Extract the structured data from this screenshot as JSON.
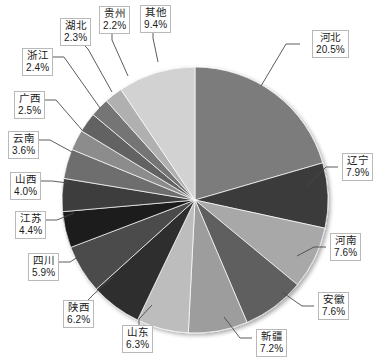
{
  "chart_data": {
    "type": "pie",
    "title": "",
    "subtitle": "",
    "xlabel": "",
    "ylabel": "",
    "legend_position": "none",
    "grid": false,
    "labels_show_percent": true,
    "start_angle_deg": 0,
    "direction": "clockwise",
    "categories": [
      "河北",
      "辽宁",
      "河南",
      "安徽",
      "新疆",
      "山东",
      "陕西",
      "四川",
      "江苏",
      "山西",
      "云南",
      "广西",
      "浙江",
      "湖北",
      "贵州",
      "其他"
    ],
    "values": [
      20.5,
      7.9,
      7.6,
      7.6,
      7.2,
      6.3,
      6.2,
      5.9,
      4.4,
      4.0,
      3.6,
      2.5,
      2.4,
      2.3,
      2.2,
      9.4
    ],
    "unit": "%",
    "colors": [
      "#7b7b7b",
      "#3a3a3a",
      "#a8a8a8",
      "#5e5e5e",
      "#9d9d9d",
      "#bdbdbd",
      "#2e2e2e",
      "#4b4b4b",
      "#1c1c1c",
      "#3d3d3d",
      "#6e6e6e",
      "#8c8c8c",
      "#626262",
      "#747474",
      "#b0b0b0",
      "#d2d2d2"
    ],
    "slices": [
      {
        "label": "河北",
        "percent": "20.5%",
        "value": 20.5,
        "color": "#7b7b7b"
      },
      {
        "label": "辽宁",
        "percent": "7.9%",
        "value": 7.9,
        "color": "#3a3a3a"
      },
      {
        "label": "河南",
        "percent": "7.6%",
        "value": 7.6,
        "color": "#a8a8a8"
      },
      {
        "label": "安徽",
        "percent": "7.6%",
        "value": 7.6,
        "color": "#5e5e5e"
      },
      {
        "label": "新疆",
        "percent": "7.2%",
        "value": 7.2,
        "color": "#9d9d9d"
      },
      {
        "label": "山东",
        "percent": "6.3%",
        "value": 6.3,
        "color": "#bdbdbd"
      },
      {
        "label": "陕西",
        "percent": "6.2%",
        "value": 6.2,
        "color": "#2e2e2e"
      },
      {
        "label": "四川",
        "percent": "5.9%",
        "value": 5.9,
        "color": "#4b4b4b"
      },
      {
        "label": "江苏",
        "percent": "4.4%",
        "value": 4.4,
        "color": "#1c1c1c"
      },
      {
        "label": "山西",
        "percent": "4.0%",
        "value": 4.0,
        "color": "#3d3d3d"
      },
      {
        "label": "云南",
        "percent": "3.6%",
        "value": 3.6,
        "color": "#6e6e6e"
      },
      {
        "label": "广西",
        "percent": "2.5%",
        "value": 2.5,
        "color": "#8c8c8c"
      },
      {
        "label": "浙江",
        "percent": "2.4%",
        "value": 2.4,
        "color": "#626262"
      },
      {
        "label": "湖北",
        "percent": "2.3%",
        "value": 2.3,
        "color": "#747474"
      },
      {
        "label": "贵州",
        "percent": "2.2%",
        "value": 2.2,
        "color": "#b0b0b0"
      },
      {
        "label": "其他",
        "percent": "9.4%",
        "value": 9.4,
        "color": "#d2d2d2"
      }
    ]
  },
  "geometry": {
    "center_x": 195,
    "center_y": 200,
    "radius": 133
  },
  "callouts": [
    {
      "name": "hebei",
      "left": 312,
      "top": 30,
      "cat": "河北",
      "pct": "20.5%",
      "lx1": 300,
      "ly1": 44,
      "lx2": 286,
      "ly2": 44,
      "lx3": 261,
      "ly3": 86
    },
    {
      "name": "liaoning",
      "left": 342,
      "top": 153,
      "cat": "辽宁",
      "pct": "7.9%",
      "lx1": 338,
      "ly1": 167,
      "lx2": 326,
      "ly2": 167,
      "lx3": 307,
      "ly3": 186
    },
    {
      "name": "henan",
      "left": 330,
      "top": 233,
      "cat": "河南",
      "pct": "7.6%",
      "lx1": 326,
      "ly1": 247,
      "lx2": 314,
      "ly2": 247,
      "lx3": 297,
      "ly3": 256
    },
    {
      "name": "anhui",
      "left": 318,
      "top": 292,
      "cat": "安徽",
      "pct": "7.6%",
      "lx1": 314,
      "ly1": 306,
      "lx2": 302,
      "ly2": 306,
      "lx3": 282,
      "ly3": 292
    },
    {
      "name": "xinjiang",
      "left": 256,
      "top": 329,
      "cat": "新疆",
      "pct": "7.2%",
      "lx1": 252,
      "ly1": 338,
      "lx2": 240,
      "ly2": 338,
      "lx3": 224,
      "ly3": 317
    },
    {
      "name": "shandong",
      "left": 122,
      "top": 325,
      "cat": "山东",
      "pct": "6.3%",
      "lx1": 139,
      "ly1": 325,
      "lx2": 139,
      "ly2": 319,
      "lx3": 152,
      "ly3": 305
    },
    {
      "name": "shaanxi",
      "left": 63,
      "top": 300,
      "cat": "陕西",
      "pct": "6.2%",
      "lx1": 88,
      "ly1": 300,
      "lx2": 94,
      "ly2": 294,
      "lx3": 113,
      "ly3": 277
    },
    {
      "name": "sichuan",
      "left": 28,
      "top": 253,
      "cat": "四川",
      "pct": "5.9%",
      "lx1": 58,
      "ly1": 262,
      "lx2": 70,
      "ly2": 262,
      "lx3": 89,
      "ly3": 250
    },
    {
      "name": "jiangsu",
      "left": 15,
      "top": 211,
      "cat": "江苏",
      "pct": "4.4%",
      "lx1": 45,
      "ly1": 220,
      "lx2": 57,
      "ly2": 220,
      "lx3": 74,
      "ly3": 213
    },
    {
      "name": "shanxi",
      "left": 10,
      "top": 172,
      "cat": "山西",
      "pct": "4.0%",
      "lx1": 40,
      "ly1": 181,
      "lx2": 52,
      "ly2": 181,
      "lx3": 68,
      "ly3": 183
    },
    {
      "name": "yunnan",
      "left": 8,
      "top": 131,
      "cat": "云南",
      "pct": "3.6%",
      "lx1": 38,
      "ly1": 140,
      "lx2": 50,
      "ly2": 140,
      "lx3": 72,
      "ly3": 152
    },
    {
      "name": "guangxi",
      "left": 14,
      "top": 91,
      "cat": "广西",
      "pct": "2.5%",
      "lx1": 44,
      "ly1": 100,
      "lx2": 56,
      "ly2": 100,
      "lx3": 82,
      "ly3": 130
    },
    {
      "name": "zhejiang",
      "left": 22,
      "top": 48,
      "cat": "浙江",
      "pct": "2.4%",
      "lx1": 52,
      "ly1": 57,
      "lx2": 64,
      "ly2": 57,
      "lx3": 100,
      "ly3": 108
    },
    {
      "name": "hubei",
      "left": 60,
      "top": 18,
      "cat": "湖北",
      "pct": "2.3%",
      "lx1": 82,
      "ly1": 43,
      "lx2": 88,
      "ly2": 49,
      "lx3": 112,
      "ly3": 92
    },
    {
      "name": "guizhou",
      "left": 99,
      "top": 6,
      "cat": "贵州",
      "pct": "2.2%",
      "lx1": 112,
      "ly1": 33,
      "lx2": 112,
      "ly2": 40,
      "lx3": 128,
      "ly3": 76
    },
    {
      "name": "qita",
      "left": 140,
      "top": 5,
      "cat": "其他",
      "pct": "9.4%",
      "lx1": 153,
      "ly1": 32,
      "lx2": 153,
      "ly2": 38,
      "lx3": 158,
      "ly3": 62
    }
  ]
}
